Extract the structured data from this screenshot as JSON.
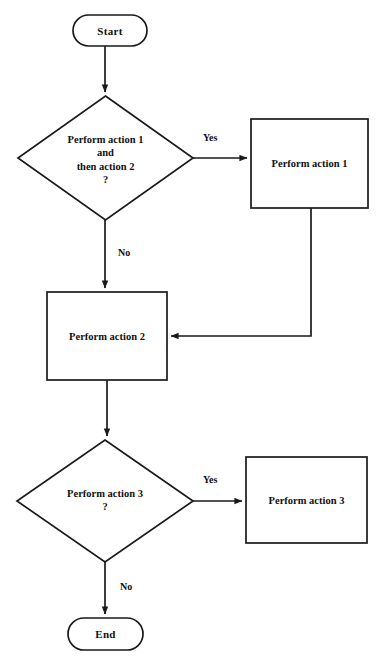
{
  "diagram": {
    "background_color": "#ffffff",
    "stroke_color": "#1a1a1a",
    "text_color": "#111111",
    "nodes": [
      {
        "id": "start",
        "type": "terminator",
        "label": "Start",
        "x": 73,
        "y": 15,
        "w": 74,
        "h": 31
      },
      {
        "id": "decision1",
        "type": "decision",
        "label": "Perform action 1\nand\nthen action 2\n?",
        "x": 18,
        "y": 96,
        "w": 175,
        "h": 124
      },
      {
        "id": "process1",
        "type": "process",
        "label": "Perform action 1",
        "x": 251,
        "y": 119,
        "w": 117,
        "h": 89
      },
      {
        "id": "process2",
        "type": "process",
        "label": "Perform action 2",
        "x": 47,
        "y": 292,
        "w": 120,
        "h": 88
      },
      {
        "id": "decision2",
        "type": "decision",
        "label": "Perform action 3\n?",
        "x": 17,
        "y": 440,
        "w": 176,
        "h": 122
      },
      {
        "id": "process3",
        "type": "process",
        "label": "Perform action 3",
        "x": 246,
        "y": 457,
        "w": 121,
        "h": 86
      },
      {
        "id": "end",
        "type": "terminator",
        "label": "End",
        "x": 68,
        "y": 618,
        "w": 75,
        "h": 32
      }
    ],
    "edges": [
      {
        "id": "start-to-decision1",
        "from": "start",
        "to": "decision1",
        "label": ""
      },
      {
        "id": "decision1-yes",
        "from": "decision1",
        "to": "process1",
        "label": "Yes"
      },
      {
        "id": "decision1-no",
        "from": "decision1",
        "to": "process2",
        "label": "No"
      },
      {
        "id": "process1-to-process2",
        "from": "process1",
        "to": "process2",
        "label": ""
      },
      {
        "id": "process2-to-decision2",
        "from": "process2",
        "to": "decision2",
        "label": ""
      },
      {
        "id": "decision2-yes",
        "from": "decision2",
        "to": "process3",
        "label": "Yes"
      },
      {
        "id": "decision2-no",
        "from": "decision2",
        "to": "end",
        "label": "No"
      }
    ],
    "edge_labels": {
      "yes_top": "Yes",
      "no_top": "No",
      "yes_bottom": "Yes",
      "no_bottom": "No"
    }
  }
}
